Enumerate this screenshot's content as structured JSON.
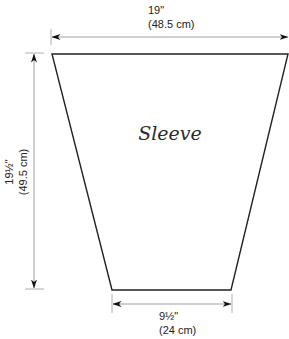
{
  "piece": {
    "name": "Sleeve"
  },
  "dimensions": {
    "top_width": {
      "imperial": "19\"",
      "metric": "(48.5 cm)"
    },
    "length": {
      "imperial": "19½\"",
      "metric": "(49.5 cm)"
    },
    "bottom_width": {
      "imperial": "9½\"",
      "metric": "(24 cm)"
    }
  },
  "colors": {
    "outline": "#222222",
    "dimension_line": "#888888",
    "arrowhead": "#111111"
  }
}
